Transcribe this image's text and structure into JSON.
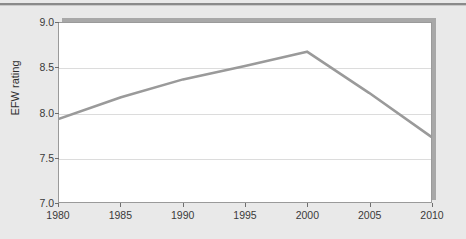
{
  "chart_data": {
    "type": "line",
    "title": "",
    "subtitle": "",
    "xlabel": "",
    "ylabel": "EFW rating",
    "x": [
      1980,
      1985,
      1990,
      1995,
      2000,
      2005,
      2010
    ],
    "xlim": [
      1980,
      2010
    ],
    "ylim": [
      7.0,
      9.0
    ],
    "yticks": [
      "7.0",
      "7.5",
      "8.0",
      "8.5",
      "9.0"
    ],
    "ytick_values": [
      7.0,
      7.5,
      8.0,
      8.5,
      9.0
    ],
    "xticks": [
      "1980",
      "1985",
      "1990",
      "1995",
      "2000",
      "2005",
      "2010"
    ],
    "xtick_values": [
      1980,
      1985,
      1990,
      1995,
      2000,
      2005,
      2010
    ],
    "grid": "horizontal",
    "legend": "none",
    "series": [
      {
        "name": "EFW rating",
        "color": "#9a9a9a",
        "values": [
          7.93,
          8.17,
          8.37,
          8.52,
          8.68,
          8.22,
          7.73
        ]
      }
    ],
    "annotations": []
  },
  "figure": {
    "background_color": "#e9e9e9",
    "plot_background_color": "#ffffff",
    "frame_color": "#9a9a9a",
    "gridline_color": "#dcdcdc",
    "shadow_color": "#a8a8a8",
    "top_rule_color": "#8a8a8a",
    "tick_color": "#6e6e6e",
    "label_color": "#3a3a3a"
  }
}
